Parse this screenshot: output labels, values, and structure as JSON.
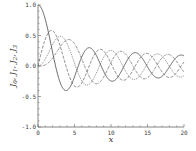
{
  "chart_data": {
    "type": "line",
    "title": "",
    "xlabel": "x",
    "ylabel": "J0, J1, J2, J3",
    "xlim": [
      0,
      20
    ],
    "ylim": [
      -1.0,
      1.0
    ],
    "xticks": [
      0,
      5,
      10,
      15,
      20
    ],
    "xtick_labels": [
      "0",
      "5",
      "10",
      "15",
      "20"
    ],
    "yticks": [
      1.0,
      0.5,
      0.0,
      -0.5,
      -1.0
    ],
    "ytick_labels": [
      "1.0",
      "0.5",
      "0.0",
      "-0.5",
      "-1.0"
    ],
    "grid": false,
    "legend": null,
    "x": [
      0,
      1,
      2,
      3,
      4,
      5,
      6,
      7,
      8,
      9,
      10,
      11,
      12,
      13,
      14,
      15,
      16,
      17,
      18,
      19,
      20
    ],
    "series": [
      {
        "name": "J0",
        "order": 0,
        "style": "solid",
        "values": [
          1.0,
          0.765,
          0.224,
          -0.26,
          -0.397,
          -0.178,
          0.151,
          0.3,
          0.172,
          -0.09,
          -0.246,
          -0.171,
          0.048,
          0.207,
          0.171,
          -0.014,
          -0.175,
          -0.17,
          -0.013,
          0.147,
          0.167
        ]
      },
      {
        "name": "J1",
        "order": 1,
        "style": "dashed",
        "values": [
          0.0,
          0.44,
          0.577,
          0.339,
          -0.066,
          -0.328,
          -0.277,
          -0.005,
          0.235,
          0.245,
          0.043,
          -0.177,
          -0.223,
          -0.07,
          0.133,
          0.205,
          0.09,
          -0.098,
          -0.188,
          -0.106,
          0.067
        ]
      },
      {
        "name": "J2",
        "order": 2,
        "style": "dotted",
        "values": [
          0.0,
          0.115,
          0.353,
          0.486,
          0.364,
          0.047,
          -0.243,
          -0.301,
          -0.113,
          0.145,
          0.255,
          0.139,
          -0.085,
          -0.218,
          -0.152,
          0.042,
          0.186,
          0.158,
          -0.008,
          -0.158,
          -0.16
        ]
      },
      {
        "name": "J3",
        "order": 3,
        "style": "dash-dot",
        "values": [
          0.0,
          0.02,
          0.129,
          0.309,
          0.43,
          0.365,
          0.115,
          -0.168,
          -0.291,
          -0.181,
          0.058,
          0.227,
          0.195,
          0.003,
          -0.177,
          -0.194,
          -0.044,
          0.135,
          0.186,
          0.072,
          -0.099
        ]
      }
    ]
  },
  "colors": {
    "line": "#555555",
    "axis": "#666666"
  }
}
